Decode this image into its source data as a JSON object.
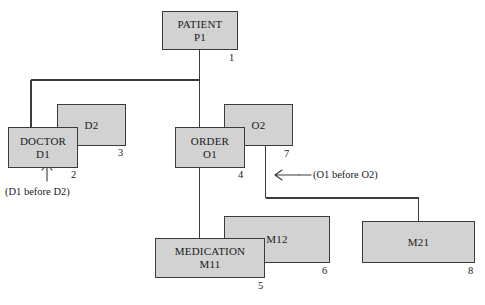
{
  "diagram": {
    "background_color": "#ffffff",
    "node_fill_color": "#d2d2d2",
    "node_border_color": "#3b3b3b",
    "line_color": "#3b3b3b",
    "nodes": [
      {
        "id": "patient_p1",
        "line1": "PATIENT",
        "line2": "P1",
        "number": "1",
        "layer": "front"
      },
      {
        "id": "doctor_d1",
        "line1": "DOCTOR",
        "line2": "D1",
        "number": "2",
        "layer": "front"
      },
      {
        "id": "d2",
        "line1": "D2",
        "line2": "",
        "number": "3",
        "layer": "back"
      },
      {
        "id": "order_o1",
        "line1": "ORDER",
        "line2": "O1",
        "number": "4",
        "layer": "front"
      },
      {
        "id": "o2",
        "line1": "O2",
        "line2": "",
        "number": "7",
        "layer": "back"
      },
      {
        "id": "medication_m11",
        "line1": "MEDICATION",
        "line2": "M11",
        "number": "5",
        "layer": "front"
      },
      {
        "id": "m12",
        "line1": "M12",
        "line2": "",
        "number": "6",
        "layer": "back"
      },
      {
        "id": "m21",
        "line1": "M21",
        "line2": "",
        "number": "8",
        "layer": "front"
      }
    ],
    "annotations": [
      {
        "id": "d1_before_d2",
        "text": "(D1 before D2)",
        "arrow": "up"
      },
      {
        "id": "o1_before_o2",
        "text": "(O1 before O2)",
        "arrow": "left"
      }
    ]
  }
}
